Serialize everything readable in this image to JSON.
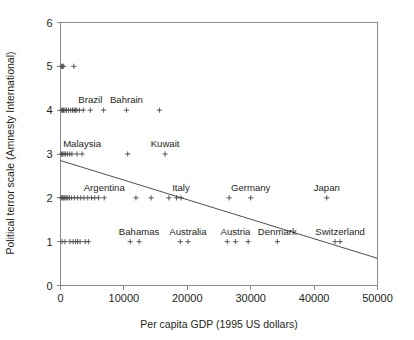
{
  "chart_data": {
    "type": "scatter",
    "title": "",
    "xlabel": "Per capita GDP (1995 US dollars)",
    "ylabel": "Political terror scale (Amnesty International)",
    "xlim": [
      0,
      50000
    ],
    "ylim": [
      0,
      6
    ],
    "xticks": [
      0,
      10000,
      20000,
      30000,
      40000,
      50000
    ],
    "xticklabels": [
      "0",
      "10000",
      "20000",
      "30000",
      "40000",
      "50000"
    ],
    "yticks": [
      0,
      1,
      2,
      3,
      4,
      5,
      6
    ],
    "yticklabels": [
      "0",
      "1",
      "2",
      "3",
      "4",
      "5",
      "6"
    ],
    "grid": false,
    "legend": null,
    "marker": "plus",
    "points": [
      {
        "x": 150,
        "y": 5
      },
      {
        "x": 320,
        "y": 5
      },
      {
        "x": 500,
        "y": 5
      },
      {
        "x": 2100,
        "y": 5
      },
      {
        "x": 180,
        "y": 4
      },
      {
        "x": 330,
        "y": 4
      },
      {
        "x": 480,
        "y": 4
      },
      {
        "x": 700,
        "y": 4
      },
      {
        "x": 950,
        "y": 4
      },
      {
        "x": 1250,
        "y": 4
      },
      {
        "x": 1600,
        "y": 4
      },
      {
        "x": 1900,
        "y": 4
      },
      {
        "x": 2150,
        "y": 4
      },
      {
        "x": 2350,
        "y": 4
      },
      {
        "x": 2600,
        "y": 4
      },
      {
        "x": 3000,
        "y": 4
      },
      {
        "x": 3600,
        "y": 4
      },
      {
        "x": 4700,
        "y": 4
      },
      {
        "x": 6800,
        "y": 4
      },
      {
        "x": 10400,
        "y": 4
      },
      {
        "x": 15600,
        "y": 4
      },
      {
        "x": 160,
        "y": 3
      },
      {
        "x": 340,
        "y": 3
      },
      {
        "x": 560,
        "y": 3
      },
      {
        "x": 800,
        "y": 3
      },
      {
        "x": 1100,
        "y": 3
      },
      {
        "x": 1450,
        "y": 3
      },
      {
        "x": 1800,
        "y": 3
      },
      {
        "x": 2600,
        "y": 3
      },
      {
        "x": 3400,
        "y": 3
      },
      {
        "x": 10600,
        "y": 3
      },
      {
        "x": 16500,
        "y": 3
      },
      {
        "x": 120,
        "y": 2
      },
      {
        "x": 260,
        "y": 2
      },
      {
        "x": 400,
        "y": 2
      },
      {
        "x": 560,
        "y": 2
      },
      {
        "x": 720,
        "y": 2
      },
      {
        "x": 900,
        "y": 2
      },
      {
        "x": 1150,
        "y": 2
      },
      {
        "x": 1400,
        "y": 2
      },
      {
        "x": 1750,
        "y": 2
      },
      {
        "x": 2200,
        "y": 2
      },
      {
        "x": 2700,
        "y": 2
      },
      {
        "x": 3200,
        "y": 2
      },
      {
        "x": 3700,
        "y": 2
      },
      {
        "x": 4300,
        "y": 2
      },
      {
        "x": 4900,
        "y": 2
      },
      {
        "x": 5400,
        "y": 2
      },
      {
        "x": 6000,
        "y": 2
      },
      {
        "x": 6900,
        "y": 2
      },
      {
        "x": 11900,
        "y": 2
      },
      {
        "x": 14300,
        "y": 2
      },
      {
        "x": 17100,
        "y": 2
      },
      {
        "x": 18300,
        "y": 2
      },
      {
        "x": 19000,
        "y": 2
      },
      {
        "x": 26600,
        "y": 2
      },
      {
        "x": 30000,
        "y": 2
      },
      {
        "x": 42000,
        "y": 2
      },
      {
        "x": 250,
        "y": 1
      },
      {
        "x": 700,
        "y": 1
      },
      {
        "x": 1500,
        "y": 1
      },
      {
        "x": 2000,
        "y": 1
      },
      {
        "x": 2400,
        "y": 1
      },
      {
        "x": 2700,
        "y": 1
      },
      {
        "x": 3100,
        "y": 1
      },
      {
        "x": 3900,
        "y": 1
      },
      {
        "x": 4400,
        "y": 1
      },
      {
        "x": 11000,
        "y": 1
      },
      {
        "x": 12400,
        "y": 1
      },
      {
        "x": 18900,
        "y": 1
      },
      {
        "x": 20100,
        "y": 1
      },
      {
        "x": 26300,
        "y": 1
      },
      {
        "x": 27600,
        "y": 1
      },
      {
        "x": 29600,
        "y": 1
      },
      {
        "x": 34200,
        "y": 1
      },
      {
        "x": 43300,
        "y": 1
      },
      {
        "x": 44100,
        "y": 1
      }
    ],
    "annotations": [
      {
        "label": "Brazil",
        "x": 4700,
        "y": 4
      },
      {
        "label": "Bahrain",
        "x": 10400,
        "y": 4
      },
      {
        "label": "Malaysia",
        "x": 3400,
        "y": 3
      },
      {
        "label": "Kuwait",
        "x": 16500,
        "y": 3
      },
      {
        "label": "Argentina",
        "x": 6900,
        "y": 2
      },
      {
        "label": "Italy",
        "x": 19000,
        "y": 2
      },
      {
        "label": "Germany",
        "x": 30000,
        "y": 2
      },
      {
        "label": "Japan",
        "x": 42000,
        "y": 2
      },
      {
        "label": "Bahamas",
        "x": 12400,
        "y": 1
      },
      {
        "label": "Australia",
        "x": 20100,
        "y": 1
      },
      {
        "label": "Austria",
        "x": 27600,
        "y": 1
      },
      {
        "label": "Denmark",
        "x": 34200,
        "y": 1
      },
      {
        "label": "Switzerland",
        "x": 44100,
        "y": 1
      }
    ],
    "trendline": {
      "type": "linear-fit",
      "x_start": 0,
      "y_start": 2.85,
      "x_end": 50000,
      "y_end": 0.62
    }
  }
}
